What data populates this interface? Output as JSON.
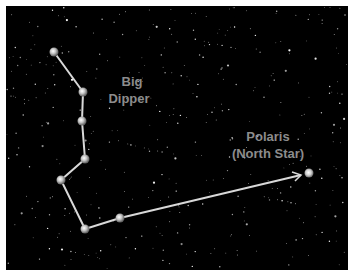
{
  "diagram": {
    "colors": {
      "background": "#000000",
      "border": "#ffffff",
      "line": "#d8d8d8",
      "label": "#8c8c8c",
      "star": "#cfcfcf"
    },
    "labels": {
      "big_dipper_line1": "Big",
      "big_dipper_line2": "Dipper",
      "polaris_line1": "Polaris",
      "polaris_line2": "(North Star)"
    },
    "constellation_stars": [
      {
        "x": 54,
        "y": 52
      },
      {
        "x": 83,
        "y": 92
      },
      {
        "x": 82,
        "y": 121
      },
      {
        "x": 85,
        "y": 159
      },
      {
        "x": 61,
        "y": 180
      },
      {
        "x": 85,
        "y": 229
      },
      {
        "x": 120,
        "y": 218
      }
    ],
    "polaris": {
      "x": 309,
      "y": 173
    },
    "pointer_arrow": {
      "from": {
        "x": 120,
        "y": 218
      },
      "to": {
        "x": 301,
        "y": 175
      }
    }
  }
}
